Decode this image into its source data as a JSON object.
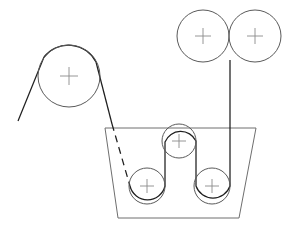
{
  "diagram": {
    "canvas": {
      "width": 294,
      "height": 234,
      "background": "#ffffff"
    },
    "colors": {
      "web_line": "#1f1f1f",
      "roller_outline": "#5a5a5a",
      "tank_outline": "#6e6e6e",
      "center_mark": "#8a8a8a"
    },
    "rollers": [
      {
        "id": "large-idler-roller",
        "label": "large idler roller",
        "cx": 69,
        "cy": 76,
        "r": 31,
        "center_mark": "plus"
      },
      {
        "id": "upper-left-nip-roller",
        "label": "upper left nip roller",
        "cx": 203,
        "cy": 36,
        "r": 26,
        "center_mark": "plus"
      },
      {
        "id": "upper-right-nip-roller",
        "label": "upper right nip roller",
        "cx": 255,
        "cy": 36,
        "r": 26,
        "center_mark": "plus"
      },
      {
        "id": "tank-middle-roller",
        "label": "tank middle lift roller",
        "cx": 179,
        "cy": 141,
        "r": 17,
        "center_mark": "plus"
      },
      {
        "id": "tank-left-immersion-roller",
        "label": "tank left immersion roller",
        "cx": 147,
        "cy": 186,
        "r": 18,
        "center_mark": "plus"
      },
      {
        "id": "tank-right-immersion-roller",
        "label": "tank right immersion roller",
        "cx": 212,
        "cy": 186,
        "r": 18,
        "center_mark": "plus"
      }
    ],
    "tank": {
      "id": "dip-tank",
      "label": "trapezoidal dip tank",
      "shape": "trapezoid",
      "points": "105,128 256,128 239,218 118,218"
    },
    "web": {
      "entry_segment": "M 18,121 L 44,57",
      "wrap_large_roller": "M 44,57 A 31,31 0 0 1 96,62",
      "descent_segment": "M 96,62 L 112,124",
      "submerged_segment": "M 112,124 L 130,186",
      "serpentine_segment": "M 130,186 A 18,18 0 0 0 165,186 L 165,142 A 17,17 0 0 1 196,141 L 196,186 A 18,18 0 0 0 230,186 L 230,60",
      "nip_tangent_point_x": 229,
      "nip_tangent_point_y": 36,
      "submerged_style": "dashed"
    },
    "center_mark": {
      "style": "plus",
      "arm_length": 9
    }
  }
}
